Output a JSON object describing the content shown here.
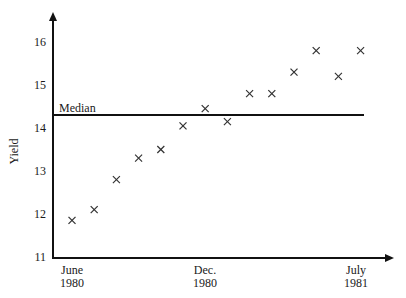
{
  "chart_data": {
    "type": "scatter",
    "title": "",
    "xlabel": "",
    "ylabel": "Yield",
    "ylim": [
      11,
      16.5
    ],
    "y_ticks": [
      11,
      12,
      13,
      14,
      15,
      16
    ],
    "x_tick_labels": [
      {
        "line1": "June",
        "line2": "1980"
      },
      {
        "line1": "Dec.",
        "line2": "1980"
      },
      {
        "line1": "July",
        "line2": "1981"
      }
    ],
    "x": [
      "Jun 1980",
      "Jul 1980",
      "Aug 1980",
      "Sep 1980",
      "Oct 1980",
      "Nov 1980",
      "Dec 1980",
      "Jan 1981",
      "Feb 1981",
      "Mar 1981",
      "Apr 1981",
      "May 1981",
      "Jun 1981",
      "Jul 1981"
    ],
    "values": [
      11.85,
      12.1,
      12.8,
      13.3,
      13.5,
      14.05,
      14.45,
      14.15,
      14.8,
      14.8,
      15.3,
      15.8,
      15.2,
      15.8
    ],
    "marker": "x",
    "reference_line": {
      "label": "Median",
      "value": 14.3
    },
    "grid": false
  }
}
